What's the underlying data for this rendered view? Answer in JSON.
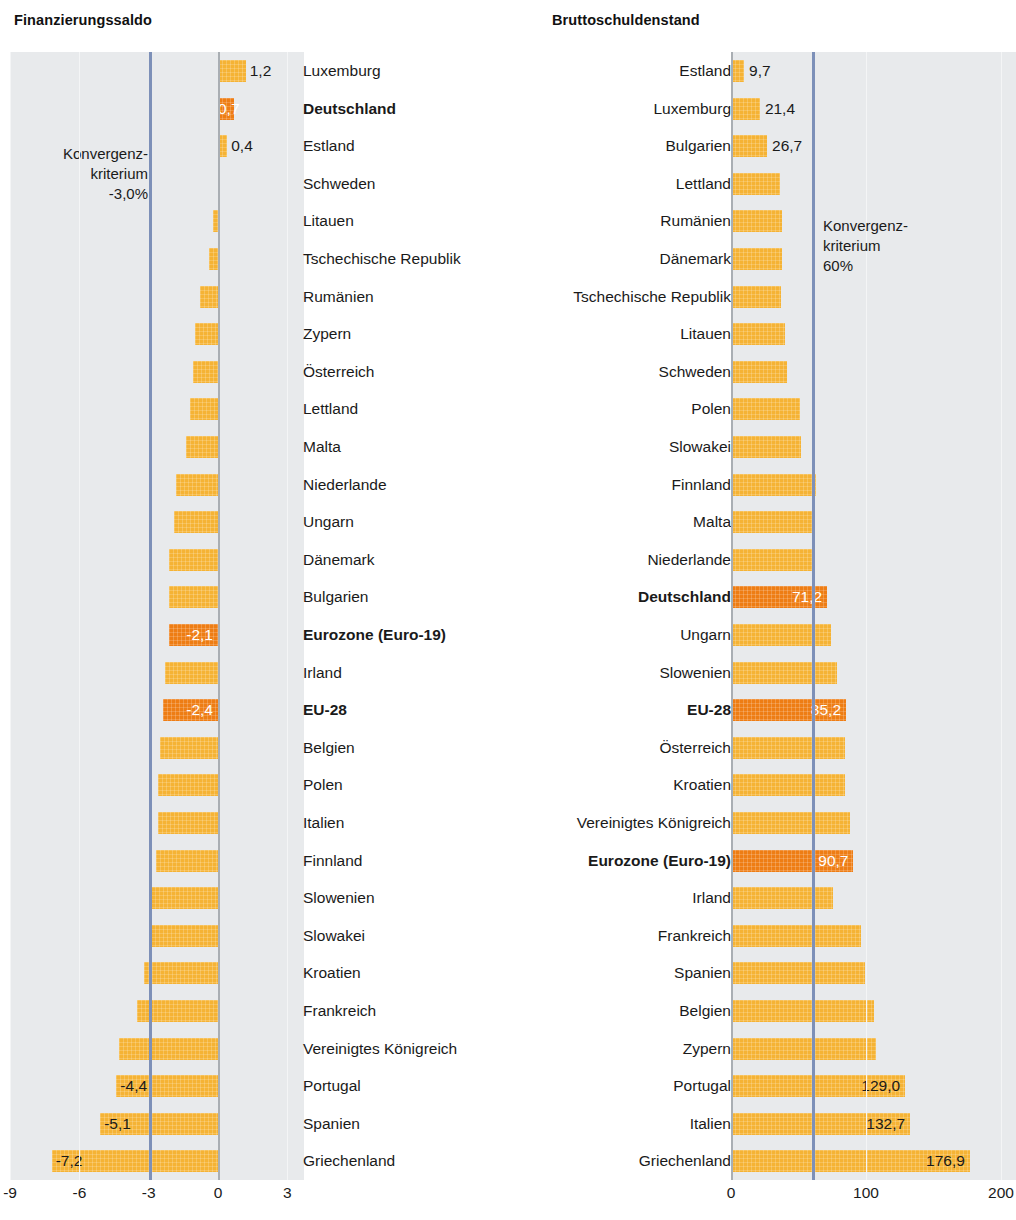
{
  "chart_data": [
    {
      "type": "bar",
      "orientation": "horizontal",
      "title": "Finanzierungssaldo",
      "xlabel": "",
      "ylabel": "",
      "xlim": [
        -9,
        3
      ],
      "ticks": [
        "-9",
        "-6",
        "-3",
        "0",
        "3"
      ],
      "tick_values": [
        -9,
        -6,
        -3,
        0,
        3
      ],
      "grid": true,
      "reference_line": {
        "value": -3.0,
        "label": "Konvergenz-\nkriterium\n-3,0%",
        "color": "#7d90b8"
      },
      "label_colors": {
        "bar": "#f5b335",
        "highlight": "#ee7d14",
        "plot_bg": "#e8eaec"
      },
      "categories": [
        "Luxemburg",
        "Deutschland",
        "Estland",
        "Schweden",
        "Litauen",
        "Tschechische Republik",
        "Rumänien",
        "Zypern",
        "Österreich",
        "Lettland",
        "Malta",
        "Niederlande",
        "Ungarn",
        "Dänemark",
        "Bulgarien",
        "Eurozone (Euro-19)",
        "Irland",
        "EU-28",
        "Belgien",
        "Polen",
        "Italien",
        "Finnland",
        "Slowenien",
        "Slowakei",
        "Kroatien",
        "Frankreich",
        "Vereinigtes Königreich",
        "Portugal",
        "Spanien",
        "Griechenland"
      ],
      "values": [
        1.2,
        0.7,
        0.4,
        0.0,
        -0.2,
        -0.4,
        -0.8,
        -1.0,
        -1.1,
        -1.2,
        -1.4,
        -1.8,
        -1.9,
        -2.1,
        -2.1,
        -2.1,
        -2.3,
        -2.4,
        -2.5,
        -2.6,
        -2.6,
        -2.7,
        -2.9,
        -2.9,
        -3.2,
        -3.5,
        -4.3,
        -4.4,
        -5.1,
        -7.2
      ],
      "value_labels": [
        "1,2",
        "0,7",
        "0,4",
        "",
        "",
        "",
        "",
        "",
        "",
        "",
        "",
        "",
        "",
        "",
        "",
        "-2,1",
        "",
        "-2,4",
        "",
        "",
        "",
        "",
        "",
        "",
        "",
        "",
        "",
        "-4,4",
        "-5,1",
        "-7,2"
      ],
      "highlighted": [
        false,
        true,
        false,
        false,
        false,
        false,
        false,
        false,
        false,
        false,
        false,
        false,
        false,
        false,
        false,
        true,
        false,
        true,
        false,
        false,
        false,
        false,
        false,
        false,
        false,
        false,
        false,
        false,
        false,
        false
      ],
      "bold_labels": [
        false,
        true,
        false,
        false,
        false,
        false,
        false,
        false,
        false,
        false,
        false,
        false,
        false,
        false,
        false,
        true,
        false,
        true,
        false,
        false,
        false,
        false,
        false,
        false,
        false,
        false,
        false,
        false,
        false,
        false
      ]
    },
    {
      "type": "bar",
      "orientation": "horizontal",
      "title": "Bruttoschuldenstand",
      "xlabel": "",
      "ylabel": "",
      "xlim": [
        0,
        200
      ],
      "ticks": [
        "0",
        "100",
        "200"
      ],
      "tick_values": [
        0,
        100,
        200
      ],
      "grid": true,
      "reference_line": {
        "value": 60,
        "label": "Konvergenz-\nkriterium\n60%",
        "color": "#7d90b8"
      },
      "label_colors": {
        "bar": "#f5b335",
        "highlight": "#ee7d14",
        "plot_bg": "#e8eaec"
      },
      "categories": [
        "Estland",
        "Luxemburg",
        "Bulgarien",
        "Lettland",
        "Rumänien",
        "Dänemark",
        "Tschechische Republik",
        "Litauen",
        "Schweden",
        "Polen",
        "Slowakei",
        "Finnland",
        "Malta",
        "Niederlande",
        "Deutschland",
        "Ungarn",
        "Slowenien",
        "EU-28",
        "Österreich",
        "Kroatien",
        "Vereinigtes Königreich",
        "Eurozone (Euro-19)",
        "Irland",
        "Frankreich",
        "Spanien",
        "Belgien",
        "Zypern",
        "Portugal",
        "Italien",
        "Griechenland"
      ],
      "values": [
        9.7,
        21.4,
        26.7,
        36.3,
        37.6,
        37.7,
        37.2,
        40.1,
        41.6,
        51.3,
        51.9,
        63.1,
        61.9,
        62.3,
        71.2,
        74.1,
        78.5,
        85.2,
        84.6,
        84.2,
        88.3,
        90.7,
        75.4,
        96.5,
        99.4,
        105.9,
        107.1,
        129.0,
        132.7,
        176.9
      ],
      "value_labels": [
        "9,7",
        "21,4",
        "26,7",
        "",
        "",
        "",
        "",
        "",
        "",
        "",
        "",
        "",
        "",
        "",
        "71,2",
        "",
        "",
        "85,2",
        "",
        "",
        "",
        "90,7",
        "",
        "",
        "",
        "",
        "",
        "129,0",
        "132,7",
        "176,9"
      ],
      "highlighted": [
        false,
        false,
        false,
        false,
        false,
        false,
        false,
        false,
        false,
        false,
        false,
        false,
        false,
        false,
        true,
        false,
        false,
        true,
        false,
        false,
        false,
        true,
        false,
        false,
        false,
        false,
        false,
        false,
        false,
        false
      ],
      "bold_labels": [
        false,
        false,
        false,
        false,
        false,
        false,
        false,
        false,
        false,
        false,
        false,
        false,
        false,
        false,
        true,
        false,
        false,
        true,
        false,
        false,
        false,
        true,
        false,
        false,
        false,
        false,
        false,
        false,
        false,
        false
      ]
    }
  ]
}
